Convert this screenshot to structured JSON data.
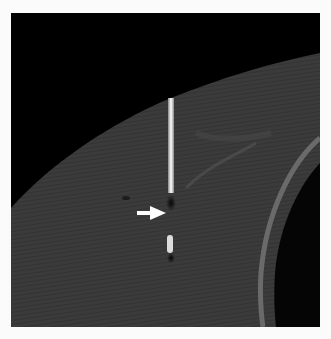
{
  "image": {
    "type": "CT scan",
    "description": "Grayscale CT image showing soft tissue with a bright linear needle artifact and a white arrow pointing to a dark gap along the needle tract",
    "annotation": {
      "type": "arrow",
      "color": "#ffffff",
      "direction": "right"
    },
    "colors": {
      "background": "#000000",
      "tissue": "#3a3a3a",
      "needle": "#f2f2f2",
      "page": "#fbfbfb"
    }
  }
}
